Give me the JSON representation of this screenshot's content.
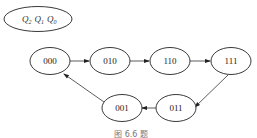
{
  "legend": {
    "vars": [
      {
        "base": "Q",
        "sub": "2"
      },
      {
        "base": "Q",
        "sub": "1"
      },
      {
        "base": "Q",
        "sub": "0"
      }
    ]
  },
  "states": [
    {
      "id": "s000",
      "label": "000",
      "cx": 50,
      "cy": 61
    },
    {
      "id": "s010",
      "label": "010",
      "cx": 110,
      "cy": 61
    },
    {
      "id": "s110",
      "label": "110",
      "cx": 170,
      "cy": 61
    },
    {
      "id": "s111",
      "label": "111",
      "cx": 231,
      "cy": 61
    },
    {
      "id": "s011",
      "label": "011",
      "cx": 176,
      "cy": 108
    },
    {
      "id": "s001",
      "label": "001",
      "cx": 122,
      "cy": 108
    }
  ],
  "transitions": [
    {
      "from": "000",
      "to": "010"
    },
    {
      "from": "010",
      "to": "110"
    },
    {
      "from": "110",
      "to": "111"
    },
    {
      "from": "111",
      "to": "011"
    },
    {
      "from": "011",
      "to": "001"
    },
    {
      "from": "001",
      "to": "000"
    }
  ],
  "caption": "图 6.6 题"
}
